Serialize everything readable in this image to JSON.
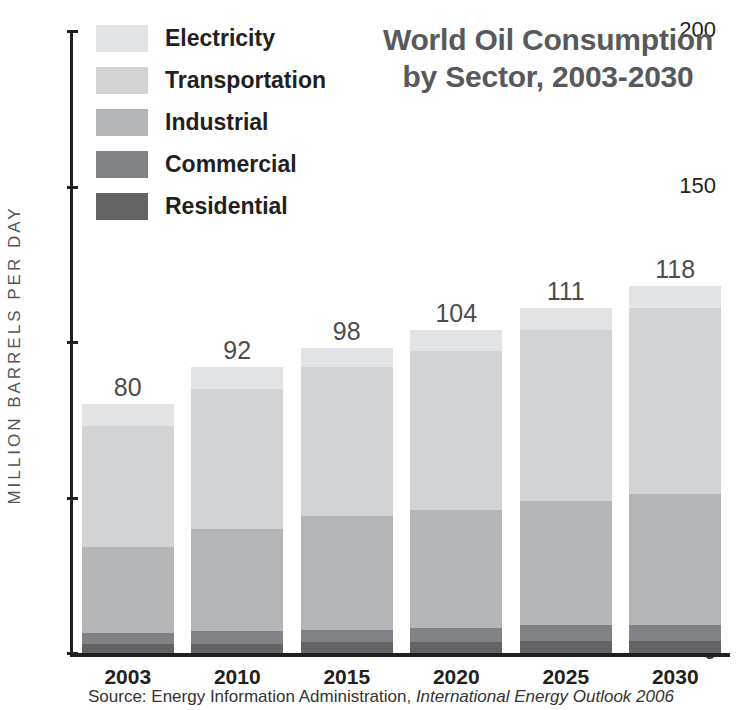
{
  "title": {
    "line1": "World Oil Consumption",
    "line2": "by Sector, 2003-2030"
  },
  "axis": {
    "y_title": "MILLION BARRELS PER DAY",
    "y_ticks": [
      "0",
      "50",
      "100",
      "150",
      "200"
    ]
  },
  "legend": {
    "items": [
      {
        "label": "Electricity",
        "color": "#e2e3e4"
      },
      {
        "label": "Transportation",
        "color": "#d2d3d4"
      },
      {
        "label": "Industrial",
        "color": "#b4b5b7"
      },
      {
        "label": "Commercial",
        "color": "#808285"
      },
      {
        "label": "Residential",
        "color": "#636466"
      }
    ]
  },
  "source": {
    "prefix": "Source:  Energy Information Administration,",
    "italic": " International Energy Outlook 2006"
  },
  "chart_data": {
    "type": "bar",
    "subtype": "stacked-vertical",
    "title": "World Oil Consumption by Sector, 2003-2030",
    "xlabel": "",
    "ylabel": "MILLION BARRELS PER DAY",
    "ylim": [
      0,
      200
    ],
    "yticks": [
      0,
      50,
      100,
      150,
      200
    ],
    "grid": false,
    "legend_position": "top-left",
    "categories": [
      "2003",
      "2010",
      "2015",
      "2020",
      "2025",
      "2030"
    ],
    "totals": [
      80,
      92,
      98,
      104,
      111,
      118
    ],
    "series": [
      {
        "name": "Residential",
        "color": "#636466",
        "values": [
          3,
          3,
          3.5,
          3.5,
          4,
          4
        ]
      },
      {
        "name": "Commercial",
        "color": "#808285",
        "values": [
          3.5,
          4,
          4,
          4.5,
          5,
          5
        ]
      },
      {
        "name": "Industrial",
        "color": "#b4b5b7",
        "values": [
          27.5,
          33,
          36.5,
          38,
          40,
          42
        ]
      },
      {
        "name": "Transportation",
        "color": "#d2d3d4",
        "values": [
          39,
          45,
          48,
          51,
          55,
          60
        ]
      },
      {
        "name": "Electricity",
        "color": "#e2e3e4",
        "values": [
          7,
          7,
          6,
          7,
          7,
          7
        ]
      }
    ]
  }
}
